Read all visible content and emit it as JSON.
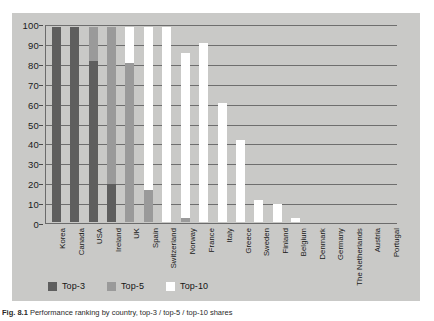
{
  "figure": {
    "caption_label": "Fig. 8.1",
    "caption_text": "Performance ranking by country, top-3 / top-5 / top-10 shares"
  },
  "legend": {
    "position": "bottom-left",
    "items": [
      {
        "label": "Top-3",
        "color": "#5e5e5e"
      },
      {
        "label": "Top-5",
        "color": "#9a9a9a"
      },
      {
        "label": "Top-10",
        "color": "#ffffff"
      }
    ]
  },
  "axes": {
    "y_ticks": [
      "100",
      "90",
      "80",
      "70",
      "60",
      "50",
      "40",
      "30",
      "20",
      "10",
      "0"
    ],
    "y_values": [
      100,
      90,
      80,
      70,
      60,
      50,
      40,
      30,
      20,
      10,
      0
    ]
  },
  "chart_data": {
    "type": "bar",
    "title": "",
    "xlabel": "",
    "ylabel": "",
    "ylim": [
      0,
      100
    ],
    "grid": true,
    "stacked": true,
    "legend_position": "bottom-left",
    "categories": [
      "Korea",
      "Canada",
      "USA",
      "Ireland",
      "UK",
      "Spain",
      "Switzerland",
      "Norway",
      "France",
      "Italy",
      "Greece",
      "Sweden",
      "Finland",
      "Belgium",
      "Denmark",
      "Germany",
      "The Netherlands",
      "Austria",
      "Portugal"
    ],
    "series": [
      {
        "name": "Top-3",
        "color": "#5e5e5e",
        "values": [
          98,
          98,
          81,
          19,
          0,
          0,
          0,
          0,
          0,
          0,
          0,
          0,
          0,
          0,
          0,
          0,
          0,
          0,
          0
        ]
      },
      {
        "name": "Top-5",
        "color": "#9a9a9a",
        "values": [
          0,
          0,
          17,
          79,
          80,
          16,
          0,
          2,
          0,
          0,
          0,
          0,
          0,
          0,
          0,
          0,
          0,
          0,
          0
        ]
      },
      {
        "name": "Top-10",
        "color": "#ffffff",
        "values": [
          0,
          0,
          0,
          0,
          18,
          82,
          98,
          83,
          90,
          60,
          41,
          11,
          9,
          2,
          0,
          0,
          0,
          0,
          0
        ]
      }
    ],
    "totals": [
      98,
      98,
      98,
      98,
      98,
      98,
      98,
      85,
      90,
      60,
      41,
      11,
      9,
      2,
      0,
      0,
      0,
      0,
      0
    ]
  }
}
